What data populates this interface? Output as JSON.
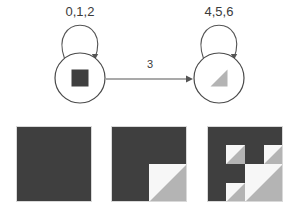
{
  "figure": {
    "colors": {
      "dark": "#3f3f3f",
      "gray": "#b4b4b4",
      "light": "#f7f7f7",
      "stroke": "#4a4a4a",
      "edge": "#555555",
      "text": "#3b3b3b",
      "border": "#d9d9d9",
      "background": "#ffffff"
    }
  },
  "automaton": {
    "states": [
      {
        "id": "state-square",
        "shape_name": "filled-square-glyph",
        "cx": 80,
        "cy": 78,
        "r": 25,
        "self_loop_label": "0,1,2",
        "self_loop_label_x": 80,
        "self_loop_label_y": 16
      },
      {
        "id": "state-triangle",
        "shape_name": "triangle-glyph",
        "cx": 219,
        "cy": 78,
        "r": 25,
        "self_loop_label": "4,5,6",
        "self_loop_label_x": 219,
        "self_loop_label_y": 16
      }
    ],
    "transition": {
      "label": "3",
      "label_x": 150,
      "label_y": 68,
      "from_x": 106,
      "to_x": 192,
      "y": 79
    }
  },
  "fractal": {
    "caption": "",
    "squares": [
      {
        "name": "iteration-1",
        "x": 16,
        "y": 126,
        "size": 76,
        "depth": 0
      },
      {
        "name": "iteration-2",
        "x": 111,
        "y": 126,
        "size": 76,
        "depth": 1
      },
      {
        "name": "iteration-3",
        "x": 207,
        "y": 126,
        "size": 76,
        "depth": 2
      }
    ]
  }
}
